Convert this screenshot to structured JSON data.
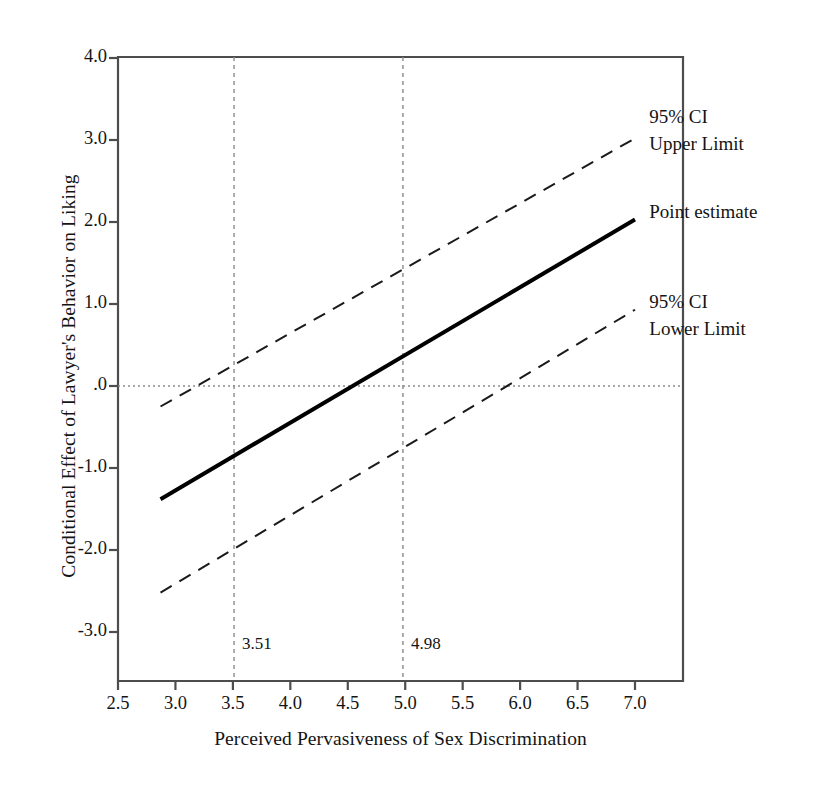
{
  "chart_data": {
    "type": "line",
    "title": "",
    "xlabel": "Perceived Pervasiveness of Sex Discrimination",
    "ylabel": "Conditional Effect of Lawyer's Behavior on Liking",
    "xlim": [
      2.5,
      7.0
    ],
    "ylim": [
      -3.0,
      4.0
    ],
    "xticks": [
      "2.5",
      "3.0",
      "3.5",
      "4.0",
      "4.5",
      "5.0",
      "5.5",
      "6.0",
      "6.5",
      "7.0"
    ],
    "xtick_values": [
      2.5,
      3.0,
      3.5,
      4.0,
      4.5,
      5.0,
      5.5,
      6.0,
      6.5,
      7.0
    ],
    "yticks": [
      "4.0",
      "3.0",
      "2.0",
      "1.0",
      ".0",
      "-1.0",
      "-2.0",
      "-3.0"
    ],
    "ytick_values": [
      4.0,
      3.0,
      2.0,
      1.0,
      0.0,
      -1.0,
      -2.0,
      -3.0
    ],
    "grid": false,
    "legend_position": "right-inline-annotations",
    "x": [
      2.87,
      7.0
    ],
    "series": [
      {
        "name": "Point estimate",
        "style": "solid",
        "width": 4,
        "color": "#000000",
        "values": [
          -1.38,
          2.03
        ]
      },
      {
        "name": "95% CI Upper Limit",
        "style": "dashed",
        "width": 2,
        "color": "#1a1a1a",
        "values": [
          -0.25,
          3.02
        ]
      },
      {
        "name": "95% CI Lower Limit",
        "style": "dashed",
        "width": 2,
        "color": "#1a1a1a",
        "values": [
          -2.52,
          0.93
        ]
      }
    ],
    "reference_lines": {
      "horizontal": [
        {
          "value": 0.0,
          "style": "dotted",
          "color": "#8c8c8c"
        }
      ],
      "vertical": [
        {
          "value": 3.51,
          "label": "3.51",
          "style": "dashed",
          "color": "#8c8c8c"
        },
        {
          "value": 4.98,
          "label": "4.98",
          "style": "dashed",
          "color": "#8c8c8c"
        }
      ]
    },
    "annotations": [
      {
        "text_line1": "95% CI",
        "text_line2": "Upper Limit",
        "x": 7.02,
        "y": 3.28
      },
      {
        "text_line1": "Point estimate",
        "text_line2": "",
        "x": 7.02,
        "y": 2.12
      },
      {
        "text_line1": "95% CI",
        "text_line2": "Lower Limit",
        "x": 7.02,
        "y": 1.02
      }
    ],
    "frame_color": "#4d4d4d"
  }
}
